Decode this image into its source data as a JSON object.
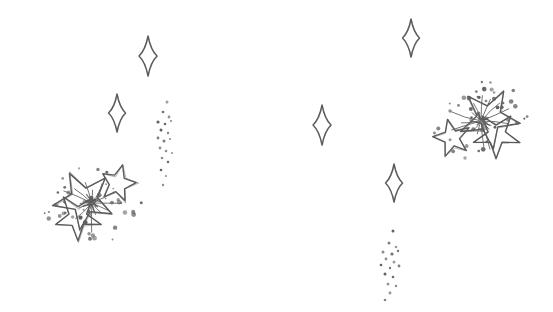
{
  "canvas": {
    "width": 553,
    "height": 312,
    "background_color": "#ffffff",
    "title": "Hand-drawn sparkle and star burst illustration",
    "description": "A white page with two sketched star-burst clusters, four small four-pointed diamond sparkles, and two vertical trails of scattered dots."
  },
  "style": {
    "ink_color": "#5b5b5b",
    "ink_color_light": "#7a7a7a",
    "ink_color_dark": "#4a4a4a",
    "stroke_width": 1.4,
    "dot_color": "#5e5e5e"
  },
  "elements": {
    "sparkles": [
      {
        "id": "sparkle-top-left",
        "label": "Four-pointed sparkle",
        "cx": 148,
        "cy": 56,
        "rx": 9,
        "ry": 20,
        "rotation": 0
      },
      {
        "id": "sparkle-mid-left",
        "label": "Four-pointed sparkle",
        "cx": 117,
        "cy": 113,
        "rx": 8.5,
        "ry": 19,
        "rotation": 0
      },
      {
        "id": "sparkle-center",
        "label": "Four-pointed sparkle",
        "cx": 322,
        "cy": 125,
        "rx": 9,
        "ry": 20,
        "rotation": 0
      },
      {
        "id": "sparkle-top-right",
        "label": "Four-pointed sparkle",
        "cx": 411,
        "cy": 38,
        "rx": 8.5,
        "ry": 19,
        "rotation": 0
      },
      {
        "id": "sparkle-bottom-right",
        "label": "Four-pointed sparkle",
        "cx": 394,
        "cy": 183,
        "rx": 8.5,
        "ry": 19,
        "rotation": 0
      }
    ],
    "clusters": [
      {
        "id": "burst-left",
        "label": "Left star burst cluster",
        "cx": 92,
        "cy": 203,
        "stars": [
          {
            "id": "burst-left-star-large",
            "cx": 84,
            "cy": 200,
            "r": 31,
            "inner_ratio": 0.42,
            "rotation": -28
          },
          {
            "id": "burst-left-star-small",
            "cx": 118,
            "cy": 184,
            "r": 19,
            "inner_ratio": 0.45,
            "rotation": 14
          },
          {
            "id": "burst-left-star-lower",
            "cx": 78,
            "cy": 217,
            "r": 24,
            "inner_ratio": 0.4,
            "rotation": 36
          }
        ],
        "rays": 16,
        "ray_length": 26,
        "dot_count": 46,
        "dot_spread_x": 52,
        "dot_spread_y": 40
      },
      {
        "id": "burst-right",
        "label": "Right star burst cluster",
        "cx": 481,
        "cy": 121,
        "stars": [
          {
            "id": "burst-right-star-large",
            "cx": 489,
            "cy": 118,
            "r": 31,
            "inner_ratio": 0.42,
            "rotation": 28
          },
          {
            "id": "burst-right-star-small",
            "cx": 452,
            "cy": 138,
            "r": 19,
            "inner_ratio": 0.45,
            "rotation": -14
          },
          {
            "id": "burst-right-star-lower",
            "cx": 496,
            "cy": 135,
            "r": 24,
            "inner_ratio": 0.4,
            "rotation": -36
          }
        ],
        "rays": 16,
        "ray_length": 26,
        "dot_count": 46,
        "dot_spread_x": 52,
        "dot_spread_y": 40
      }
    ],
    "dot_trails": [
      {
        "id": "trail-upper-left",
        "label": "Upper left falling dust trail",
        "dots": [
          {
            "x": 167,
            "y": 102,
            "r": 1.5
          },
          {
            "x": 163,
            "y": 112,
            "r": 1.3
          },
          {
            "x": 169,
            "y": 117,
            "r": 1.4
          },
          {
            "x": 158,
            "y": 122,
            "r": 1.6
          },
          {
            "x": 165,
            "y": 124,
            "r": 1.3
          },
          {
            "x": 171,
            "y": 121,
            "r": 1.1
          },
          {
            "x": 161,
            "y": 130,
            "r": 1.5
          },
          {
            "x": 168,
            "y": 133,
            "r": 1.2
          },
          {
            "x": 158,
            "y": 138,
            "r": 1.4
          },
          {
            "x": 164,
            "y": 141,
            "r": 1.5
          },
          {
            "x": 170,
            "y": 139,
            "r": 1.1
          },
          {
            "x": 160,
            "y": 148,
            "r": 1.4
          },
          {
            "x": 166,
            "y": 151,
            "r": 1.3
          },
          {
            "x": 172,
            "y": 153,
            "r": 1.1
          },
          {
            "x": 162,
            "y": 158,
            "r": 1.3
          },
          {
            "x": 168,
            "y": 162,
            "r": 1.2
          },
          {
            "x": 161,
            "y": 170,
            "r": 1.3
          },
          {
            "x": 166,
            "y": 176,
            "r": 1.1
          },
          {
            "x": 163,
            "y": 185,
            "r": 1.2
          }
        ]
      },
      {
        "id": "trail-lower-right",
        "label": "Lower right falling dust trail",
        "dots": [
          {
            "x": 393,
            "y": 231,
            "r": 1.5
          },
          {
            "x": 389,
            "y": 243,
            "r": 1.5
          },
          {
            "x": 396,
            "y": 247,
            "r": 1.3
          },
          {
            "x": 383,
            "y": 252,
            "r": 1.5
          },
          {
            "x": 392,
            "y": 254,
            "r": 1.6
          },
          {
            "x": 398,
            "y": 251,
            "r": 1.2
          },
          {
            "x": 386,
            "y": 259,
            "r": 1.4
          },
          {
            "x": 394,
            "y": 262,
            "r": 1.5
          },
          {
            "x": 381,
            "y": 265,
            "r": 1.3
          },
          {
            "x": 390,
            "y": 268,
            "r": 1.2
          },
          {
            "x": 399,
            "y": 266,
            "r": 1.4
          },
          {
            "x": 385,
            "y": 274,
            "r": 1.5
          },
          {
            "x": 393,
            "y": 277,
            "r": 1.3
          },
          {
            "x": 388,
            "y": 284,
            "r": 1.5
          },
          {
            "x": 396,
            "y": 286,
            "r": 1.2
          },
          {
            "x": 390,
            "y": 293,
            "r": 1.4
          },
          {
            "x": 385,
            "y": 300,
            "r": 1.3
          }
        ]
      }
    ]
  }
}
